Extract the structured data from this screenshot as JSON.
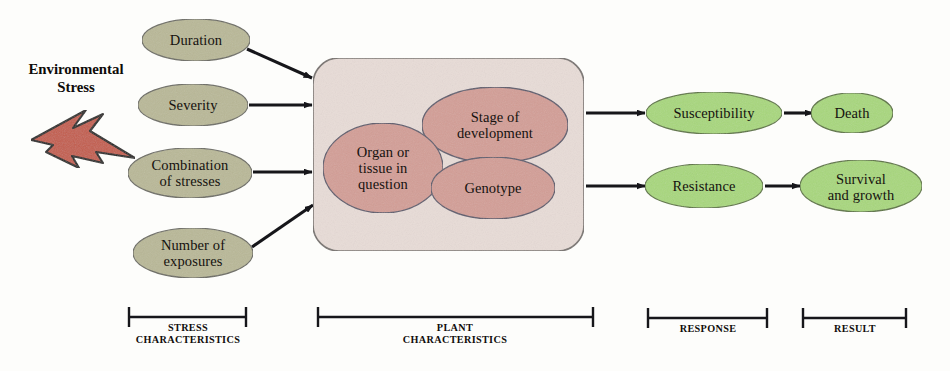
{
  "diagram": {
    "title_block": {
      "text": "Environmental\nStress",
      "icon": "lightning-bolt-icon"
    },
    "stress_nodes": [
      {
        "id": "duration",
        "label": "Duration"
      },
      {
        "id": "severity",
        "label": "Severity"
      },
      {
        "id": "combination-of-stresses",
        "label": "Combination\nof stresses"
      },
      {
        "id": "number-of-exposures",
        "label": "Number of\nexposures"
      }
    ],
    "plant_nodes": [
      {
        "id": "organ-or-tissue-in-question",
        "label": "Organ or\ntissue in\nquestion"
      },
      {
        "id": "stage-of-development",
        "label": "Stage of\ndevelopment"
      },
      {
        "id": "genotype",
        "label": "Genotype"
      }
    ],
    "response_nodes": [
      {
        "id": "susceptibility",
        "label": "Susceptibility"
      },
      {
        "id": "resistance",
        "label": "Resistance"
      }
    ],
    "result_nodes": [
      {
        "id": "death",
        "label": "Death"
      },
      {
        "id": "survival-and-growth",
        "label": "Survival\nand growth"
      }
    ],
    "brackets": [
      {
        "id": "stress-characteristics",
        "label": "STRESS\nCHARACTERISTICS"
      },
      {
        "id": "plant-characteristics",
        "label": "PLANT\nCHARACTERISTICS"
      },
      {
        "id": "response",
        "label": "RESPONSE"
      },
      {
        "id": "result",
        "label": "RESULT"
      }
    ],
    "colors": {
      "stress_ellipse_fill": "#b9b897",
      "plant_ellipse_fill": "#d39e96",
      "plant_box_fill": "#e8dcd7",
      "response_ellipse_fill": "#a8d77c",
      "bolt_fill": "#c35d4d",
      "stroke": "#3a3a44",
      "arrow": "#16161a"
    }
  }
}
